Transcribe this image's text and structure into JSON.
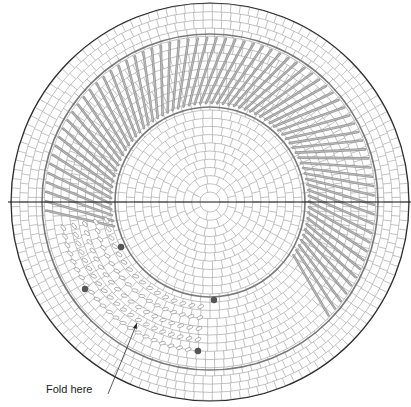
{
  "diagram": {
    "center": [
      210,
      202
    ],
    "outer_radius": 199,
    "outer_band_radius": 168,
    "inner_circle_radius": 95,
    "colors": {
      "background": "#ffffff",
      "grid": "#9a9a9a",
      "border": "#2a2a2a",
      "ring": "#7a7a7a",
      "strip": "#8c8c8c",
      "dot": "#555555"
    },
    "axis_line": {
      "y": 202,
      "x1": 8,
      "x2": 411
    },
    "strip_sector": {
      "start_deg": 170,
      "end_deg": 400,
      "count": 70
    },
    "pattern_sector": {
      "start_deg": 95,
      "end_deg": 170
    },
    "dots": [
      [
        121,
        247
      ],
      [
        85,
        289
      ],
      [
        214,
        300
      ],
      [
        198,
        351
      ]
    ],
    "fold_label": {
      "text": "Fold here",
      "x": 46,
      "y": 390,
      "arrow_from": [
        108,
        394
      ],
      "arrow_to": [
        137,
        323
      ]
    }
  }
}
